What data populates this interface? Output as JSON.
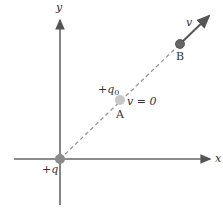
{
  "axes": {
    "x_label": "x",
    "y_label": "y",
    "color": "#666666"
  },
  "charges": {
    "source": {
      "label_sign": "+",
      "label_var": "q",
      "color": "#8a8a8a"
    },
    "test": {
      "label_sign": "+",
      "label_var": "q",
      "label_sub": "0"
    }
  },
  "points": {
    "A": {
      "label": "A",
      "color": "#c8c8c8",
      "velocity_label": "v = 0"
    },
    "B": {
      "label": "B",
      "color": "#666666",
      "velocity_label": "v"
    }
  },
  "path": {
    "style": "dashed",
    "color": "#999999"
  }
}
